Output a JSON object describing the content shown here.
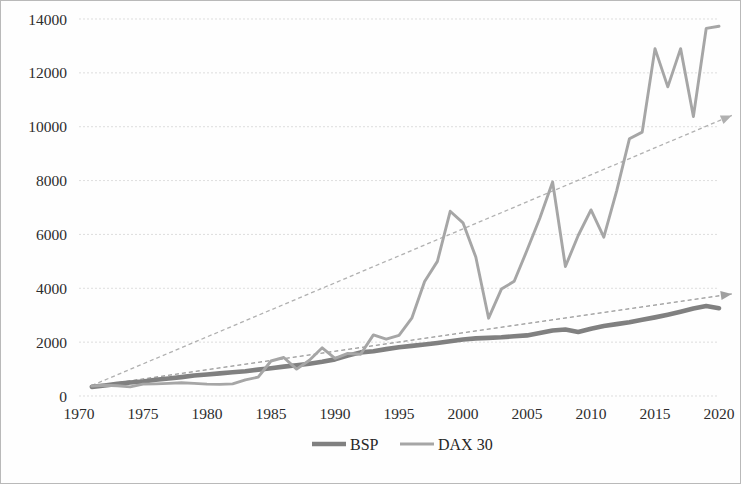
{
  "chart_data": {
    "type": "line",
    "title": "",
    "subtitle": "",
    "xlabel": "",
    "ylabel": "",
    "xlim": [
      1970,
      2020
    ],
    "ylim": [
      0,
      14000
    ],
    "y_ticks": [
      0,
      2000,
      4000,
      6000,
      8000,
      10000,
      12000,
      14000
    ],
    "x_ticks": [
      1970,
      1975,
      1980,
      1985,
      1990,
      1995,
      2000,
      2005,
      2010,
      2015,
      2020
    ],
    "grid": "horizontal",
    "legend_position": "bottom-center",
    "legend": [
      "BSP",
      "DAX 30"
    ],
    "colors": {
      "bsp": "#808080",
      "dax": "#a6a6a6",
      "bsp_trend": "#a0a0a0",
      "dax_trend": "#b0b0b0",
      "grid": "#d9d9d9",
      "border": "#b9b9b9",
      "text": "#2d2d2d"
    },
    "series": [
      {
        "name": "BSP",
        "color": "#808080",
        "x": [
          1971,
          1972,
          1973,
          1974,
          1975,
          1976,
          1977,
          1978,
          1979,
          1980,
          1981,
          1982,
          1983,
          1984,
          1985,
          1986,
          1987,
          1988,
          1989,
          1990,
          1991,
          1992,
          1993,
          1994,
          1995,
          1996,
          1997,
          1998,
          1999,
          2000,
          2001,
          2002,
          2003,
          2004,
          2005,
          2006,
          2007,
          2008,
          2009,
          2010,
          2011,
          2012,
          2013,
          2014,
          2015,
          2016,
          2017,
          2018,
          2019,
          2020
        ],
        "values": [
          340,
          390,
          450,
          500,
          540,
          600,
          650,
          700,
          760,
          800,
          840,
          880,
          920,
          980,
          1030,
          1090,
          1140,
          1200,
          1270,
          1360,
          1500,
          1620,
          1660,
          1740,
          1810,
          1860,
          1910,
          1970,
          2030,
          2100,
          2140,
          2160,
          2180,
          2220,
          2250,
          2340,
          2430,
          2470,
          2380,
          2500,
          2600,
          2670,
          2740,
          2830,
          2920,
          3020,
          3130,
          3250,
          3340,
          3260
        ]
      },
      {
        "name": "DAX 30",
        "color": "#a6a6a6",
        "x": [
          1971,
          1972,
          1973,
          1974,
          1975,
          1976,
          1977,
          1978,
          1979,
          1980,
          1981,
          1982,
          1983,
          1984,
          1985,
          1986,
          1987,
          1988,
          1989,
          1990,
          1991,
          1992,
          1993,
          1994,
          1995,
          1996,
          1997,
          1998,
          1999,
          2000,
          2001,
          2002,
          2003,
          2004,
          2005,
          2006,
          2007,
          2008,
          2009,
          2010,
          2011,
          2012,
          2013,
          2014,
          2015,
          2016,
          2017,
          2018,
          2019,
          2020
        ],
        "values": [
          370,
          400,
          380,
          340,
          440,
          450,
          470,
          490,
          470,
          440,
          430,
          450,
          600,
          700,
          1300,
          1430,
          1000,
          1330,
          1790,
          1400,
          1580,
          1550,
          2270,
          2110,
          2250,
          2890,
          4250,
          5000,
          6860,
          6430,
          5160,
          2890,
          3970,
          4260,
          5410,
          6600,
          7950,
          4810,
          5960,
          6910,
          5900,
          7610,
          9550,
          9800,
          12900,
          11480,
          12900,
          10380,
          13650,
          13730
        ]
      }
    ],
    "trendlines": [
      {
        "name": "BSP trend",
        "color": "#a0a0a0",
        "style": "dashed",
        "arrow": true,
        "x": [
          1971,
          2021
        ],
        "values": [
          360,
          3790
        ]
      },
      {
        "name": "DAX 30 trend",
        "color": "#b0b0b0",
        "style": "dashed",
        "arrow": true,
        "x": [
          1971,
          2021
        ],
        "values": [
          390,
          10420
        ]
      }
    ]
  },
  "axes": {
    "y_tick_labels": [
      "14000",
      "12000",
      "10000",
      "8000",
      "6000",
      "4000",
      "2000",
      "0"
    ],
    "x_tick_labels": [
      "1970",
      "1975",
      "1980",
      "1985",
      "1990",
      "1995",
      "2000",
      "2005",
      "2010",
      "2015",
      "2020"
    ]
  },
  "legend": {
    "items": [
      {
        "label": "BSP",
        "color": "#808080",
        "width": 4.5
      },
      {
        "label": "DAX 30",
        "color": "#a6a6a6",
        "width": 3
      }
    ]
  }
}
